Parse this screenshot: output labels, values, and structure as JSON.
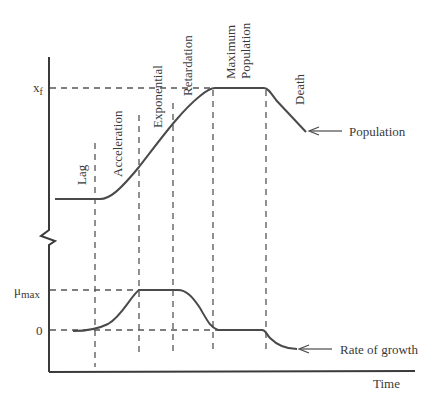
{
  "diagram": {
    "title": "",
    "y_labels": {
      "xf_main": "x",
      "xf_sub": "f",
      "mumax_main": "μ",
      "mumax_sub": "max",
      "zero": "0"
    },
    "phase_labels": [
      {
        "id": "lag",
        "text": "Lag"
      },
      {
        "id": "acceleration",
        "text": "Acceleration"
      },
      {
        "id": "exponential",
        "text": "Exponential"
      },
      {
        "id": "retardation",
        "text": "Retardation"
      },
      {
        "id": "maximum-population-1",
        "text": "Maximum"
      },
      {
        "id": "maximum-population-2",
        "text": "Population"
      },
      {
        "id": "death",
        "text": "Death"
      }
    ],
    "curve_labels": {
      "population": "Population",
      "rate_of_growth": "Rate of growth"
    },
    "x_axis_label": "Time",
    "phases": [
      "Lag",
      "Acceleration",
      "Exponential",
      "Retardation",
      "Maximum Population",
      "Death"
    ],
    "curves": [
      {
        "name": "Population",
        "description": "Sigmoidal rise from low plateau to x_f, plateau, then decline in death phase"
      },
      {
        "name": "Rate of growth",
        "description": "Rises from 0 to μ_max during acceleration, plateaus in exponential phase, falls to 0 at maximum population, negative in death phase"
      }
    ]
  }
}
